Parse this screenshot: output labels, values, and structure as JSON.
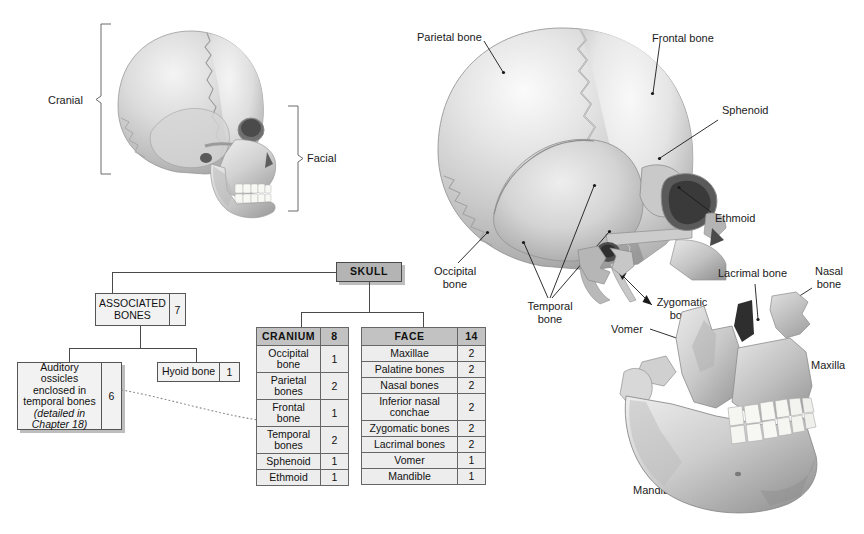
{
  "figure": {
    "background": "#ffffff"
  },
  "overview_skull": {
    "caption_left": "Cranial",
    "caption_right": "Facial"
  },
  "flowchart": {
    "root": {
      "label": "SKULL",
      "fill": "#b4b4b4"
    },
    "associated": {
      "label": "ASSOCIATED BONES",
      "count": "7"
    },
    "ossicles": {
      "line1": "Auditory ossicles",
      "line2": "enclosed in",
      "line3": "temporal bones",
      "line4": "(detailed in",
      "line5": "Chapter 18)",
      "count": "6"
    },
    "hyoid": {
      "label": "Hyoid bone",
      "count": "1"
    },
    "cranium_table": {
      "header": {
        "name": "CRANIUM",
        "count": "8"
      },
      "rows": [
        {
          "name": "Occipital bone",
          "count": "1"
        },
        {
          "name": "Parietal bones",
          "count": "2"
        },
        {
          "name": "Frontal bone",
          "count": "1"
        },
        {
          "name": "Temporal bones",
          "count": "2"
        },
        {
          "name": "Sphenoid",
          "count": "1"
        },
        {
          "name": "Ethmoid",
          "count": "1"
        }
      ]
    },
    "face_table": {
      "header": {
        "name": "FACE",
        "count": "14"
      },
      "rows": [
        {
          "name": "Maxillae",
          "count": "2"
        },
        {
          "name": "Palatine bones",
          "count": "2"
        },
        {
          "name": "Nasal bones",
          "count": "2"
        },
        {
          "name": "Inferior nasal conchae",
          "count": "2"
        },
        {
          "name": "Zygomatic bones",
          "count": "2"
        },
        {
          "name": "Lacrimal bones",
          "count": "2"
        },
        {
          "name": "Vomer",
          "count": "1"
        },
        {
          "name": "Mandible",
          "count": "1"
        }
      ]
    }
  },
  "callouts": {
    "parietal": "Parietal bone",
    "frontal": "Frontal bone",
    "sphenoid": "Sphenoid",
    "ethmoid": "Ethmoid",
    "occipital_l1": "Occipital",
    "occipital_l2": "bone",
    "temporal_l1": "Temporal",
    "temporal_l2": "bone",
    "vomer": "Vomer",
    "zygomatic_l1": "Zygomatic",
    "zygomatic_l2": "bone",
    "lacrimal": "Lacrimal bone",
    "nasal_l1": "Nasal",
    "nasal_l2": "bone",
    "maxilla": "Maxilla",
    "mandible": "Mandible"
  }
}
